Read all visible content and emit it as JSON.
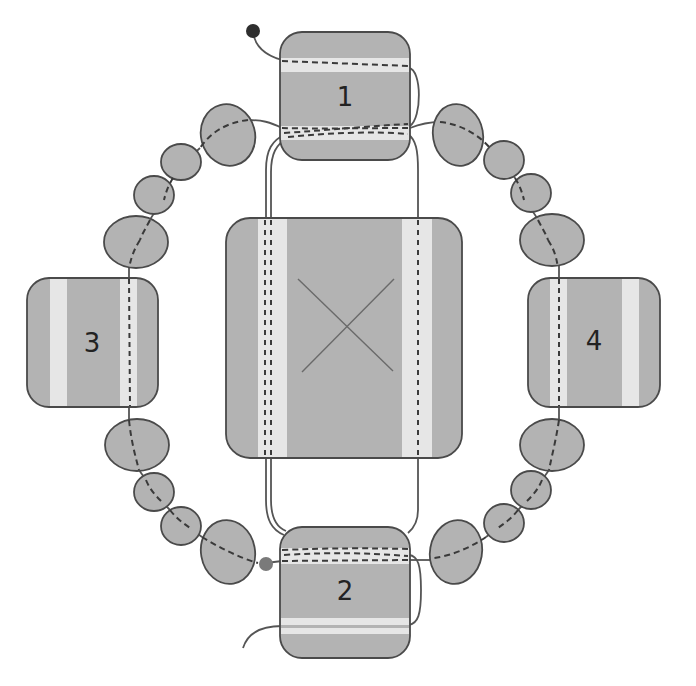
{
  "diagram": {
    "colors": {
      "tile_fill": "#b3b3b3",
      "stripe_fill": "#e6e6e6",
      "outline": "#4a4a4a",
      "thread": "#555555",
      "dashed_thread": "#3a3a3a",
      "bead_fill": "#b3b3b3",
      "start_dot": "#2e2e2e",
      "end_dot": "#7a7a7a",
      "background": "#ffffff"
    },
    "tiles": [
      {
        "id": "1",
        "label": "1"
      },
      {
        "id": "2",
        "label": "2"
      },
      {
        "id": "3",
        "label": "3"
      },
      {
        "id": "4",
        "label": "4"
      },
      {
        "id": "center",
        "label": ""
      }
    ],
    "beads": {
      "count": 16
    }
  }
}
